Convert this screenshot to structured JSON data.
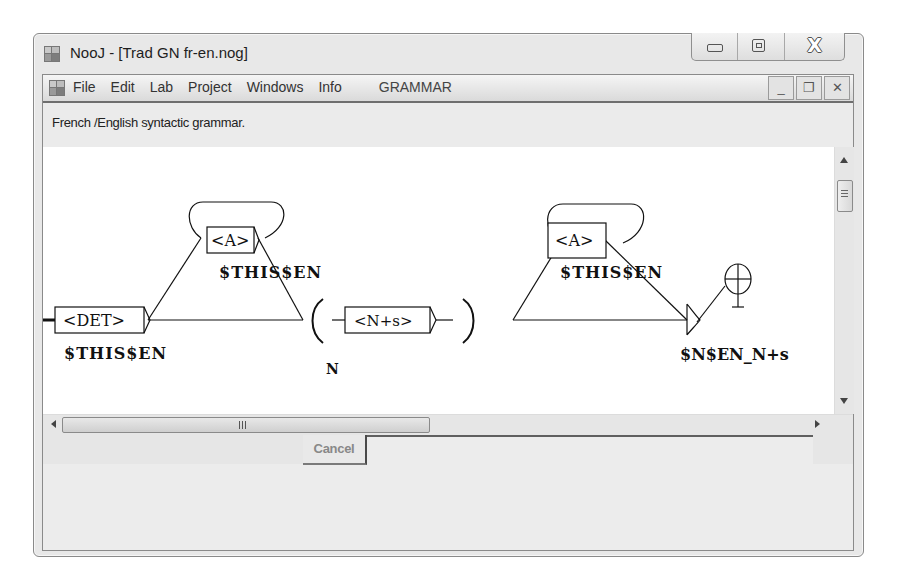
{
  "window": {
    "title": "NooJ - [Trad GN fr-en.nog]",
    "caption_buttons": [
      {
        "name": "minimize",
        "icon": "minimize-icon"
      },
      {
        "name": "maximize",
        "icon": "maximize-icon"
      },
      {
        "name": "close",
        "icon": "close-icon",
        "glyph": "X"
      }
    ]
  },
  "menu": {
    "items": [
      "File",
      "Edit",
      "Lab",
      "Project",
      "Windows",
      "Info"
    ],
    "context_label": "GRAMMAR",
    "mdi_buttons": [
      {
        "name": "mdi-minimize",
        "glyph": "_"
      },
      {
        "name": "mdi-restore",
        "glyph": "❐"
      },
      {
        "name": "mdi-close",
        "glyph": "✕"
      }
    ]
  },
  "description": "French /English  syntactic grammar.",
  "grammar_graph": {
    "nodes": [
      {
        "id": "det",
        "label": "<DET>",
        "output": "$THIS$EN"
      },
      {
        "id": "adj1",
        "label": "<A>",
        "output": "$THIS$EN",
        "loop": true
      },
      {
        "id": "var_open",
        "label": "(",
        "variable": "N"
      },
      {
        "id": "noun",
        "label": "<N+s>"
      },
      {
        "id": "var_close",
        "label": ")"
      },
      {
        "id": "adj2",
        "label": "<A>",
        "output": "$THIS$EN",
        "loop": true
      },
      {
        "id": "final_output",
        "output": "$N$EN_N+s"
      },
      {
        "id": "terminal",
        "label": "end-node"
      }
    ]
  },
  "scrollbars": {
    "horizontal_grip": "III",
    "vertical_grip": "≡"
  },
  "footer": {
    "cancel_label": "Cancel"
  }
}
